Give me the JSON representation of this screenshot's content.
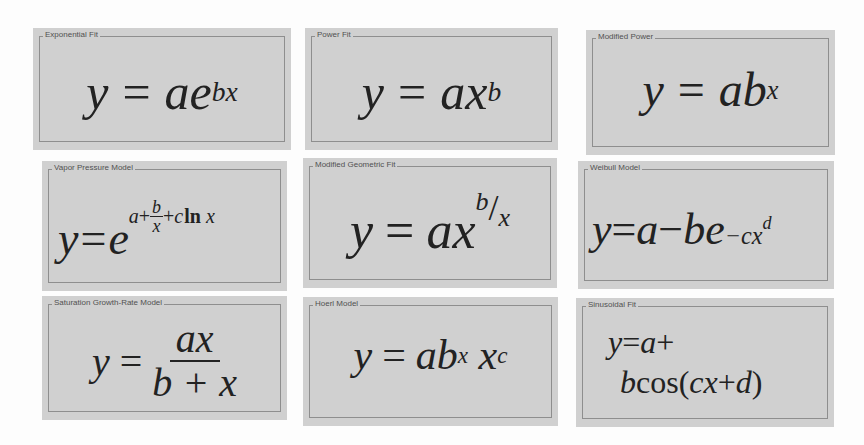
{
  "panels": [
    {
      "title": "Exponential Fit",
      "equation": "y = ae^(bx)",
      "parts": {
        "lhs": "y",
        "eq": "=",
        "a": "a",
        "base": "e",
        "exp": "bx"
      }
    },
    {
      "title": "Power Fit",
      "equation": "y = ax^b",
      "parts": {
        "lhs": "y",
        "eq": "=",
        "a": "a",
        "base": "x",
        "exp": "b"
      }
    },
    {
      "title": "Modified Power",
      "equation": "y = ab^x",
      "parts": {
        "lhs": "y",
        "eq": "=",
        "a": "a",
        "base": "b",
        "exp": "x"
      }
    },
    {
      "title": "Vapor Pressure Model",
      "equation": "y = e^(a + b/x + c ln x)",
      "parts": {
        "lhs": "y",
        "eq": "=",
        "base": "e",
        "exp_a": "a",
        "plus1": "+",
        "frac_num": "b",
        "frac_den": "x",
        "plus2": "+",
        "exp_c": "c",
        "ln": "ln",
        "exp_x": "x"
      }
    },
    {
      "title": "Modified Geometric Fit",
      "equation": "y = ax^(b/x)",
      "parts": {
        "lhs": "y",
        "eq": "=",
        "a": "a",
        "base": "x",
        "exp_num": "b",
        "slash": "/",
        "exp_den": "x"
      }
    },
    {
      "title": "Weibull Model",
      "equation": "y = a - be^(-cx^d)",
      "parts": {
        "lhs": "y",
        "eq": "=",
        "a": "a",
        "minus": "−",
        "b": "b",
        "base": "e",
        "exp": "−cx",
        "exp_exp": "d"
      }
    },
    {
      "title": "Saturation Growth-Rate Model",
      "equation": "y = ax / (b + x)",
      "parts": {
        "lhs": "y",
        "eq": "=",
        "num": "ax",
        "den": "b + x"
      }
    },
    {
      "title": "Hoerl Model",
      "equation": "y = ab^x x^c",
      "parts": {
        "lhs": "y",
        "eq": "=",
        "a": "a",
        "b": "b",
        "b_exp": "x",
        "x": "x",
        "x_exp": "c"
      }
    },
    {
      "title": "Sinusoidal Fit",
      "equation": "y = a + bcos(cx + d)",
      "parts": {
        "line1_lhs": "y",
        "line1_eq": "=",
        "line1_a": "a",
        "line1_plus": "+",
        "line2_b": "b",
        "line2_cos": "cos(",
        "line2_arg": "cx",
        "line2_plus": "+",
        "line2_d": "d",
        "line2_close": ")"
      }
    }
  ],
  "colors": {
    "panel_bg": "#d0d0d0",
    "frame": "#8e8e8e",
    "text": "#222222",
    "legend_text": "#505050",
    "page_bg": "#fdfdfd"
  }
}
